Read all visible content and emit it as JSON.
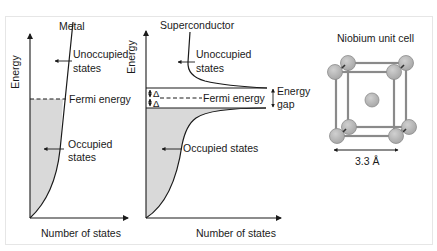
{
  "panels": {
    "metal": {
      "title": "Metal",
      "y_axis_label": "Energy",
      "x_axis_label": "Number of states",
      "unoccupied_label_line1": "Unoccupied",
      "unoccupied_label_line2": "states",
      "fermi_label": "Fermi energy",
      "occupied_label_line1": "Occupied",
      "occupied_label_line2": "states"
    },
    "superconductor": {
      "title": "Superconductor",
      "y_axis_label": "Energy",
      "x_axis_label": "Number of states",
      "unoccupied_label_line1": "Unoccupied",
      "unoccupied_label_line2": "states",
      "fermi_label": "Fermi energy",
      "gap_label_line1": "Energy",
      "gap_label_line2": "gap",
      "delta_symbol_top": "Δ",
      "delta_symbol_bottom": "Δ",
      "occupied_label": "Occupied states"
    },
    "unit_cell": {
      "title": "Niobium unit cell",
      "lattice_constant": "3.3 Å"
    }
  },
  "colors": {
    "line": "#1a1a1a",
    "fill_occupied": "#d9d9d9",
    "atom_fill": "#b8b8b8",
    "atom_stroke": "#8c8c8c",
    "cube_edge": "#8a8a8a"
  }
}
